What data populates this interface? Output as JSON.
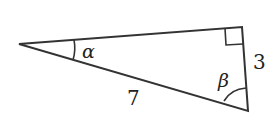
{
  "diagram": {
    "type": "right-triangle",
    "vertices": {
      "left": {
        "x": 19,
        "y": 44
      },
      "top_right": {
        "x": 242,
        "y": 27
      },
      "bottom_right": {
        "x": 248,
        "y": 111
      }
    },
    "right_angle_vertex": "top_right",
    "labels": {
      "alpha": "α",
      "beta": "β",
      "hypotenuse": "7",
      "short_leg": "3"
    },
    "stroke_color": "#333333"
  }
}
